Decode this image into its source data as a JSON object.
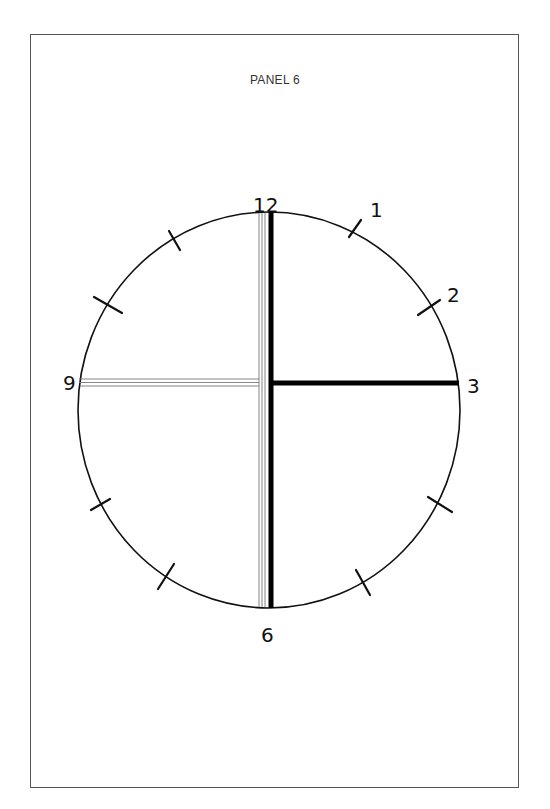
{
  "panel": {
    "title": "PANEL 6"
  },
  "clock": {
    "numerals": {
      "n12": "12",
      "n1": "1",
      "n2": "2",
      "n3": "3",
      "n6": "6",
      "n9": "9"
    },
    "tick_marks_unlabeled": [
      "11",
      "10",
      "8",
      "7",
      "5",
      "4"
    ],
    "hands": {
      "solid_thick": [
        "12-6 vertical",
        "center-to-3 horizontal"
      ],
      "hollow_triple_line": [
        "12-6 vertical",
        "9-to-center horizontal"
      ]
    },
    "colors": {
      "ink": "#111111",
      "frame": "#555555",
      "background": "#ffffff"
    }
  }
}
